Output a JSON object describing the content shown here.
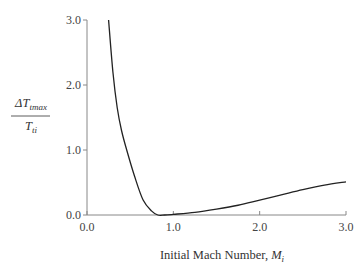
{
  "chart_data": {
    "type": "line",
    "title": "",
    "xlabel": "Initial Mach Number, M_i",
    "xlabel_main": "Initial Mach Number, ",
    "xlabel_var": "M",
    "xlabel_sub": "i",
    "ylabel": "ΔT_tmax / T_ti",
    "ylabel_num": "ΔT",
    "ylabel_num_sub": "tmax",
    "ylabel_den": "T",
    "ylabel_den_sub": "ti",
    "xlim": [
      0.0,
      3.0
    ],
    "ylim": [
      0.0,
      3.0
    ],
    "x_ticks": [
      "0.0",
      "1.0",
      "2.0",
      "3.0"
    ],
    "y_ticks": [
      "0.0",
      "1.0",
      "2.0",
      "3.0"
    ],
    "grid": false,
    "legend": null,
    "series": [
      {
        "name": "ΔT_tmax/T_ti",
        "x": [
          0.25,
          0.3,
          0.35,
          0.4,
          0.46,
          0.55,
          0.65,
          0.75,
          0.82,
          0.9,
          1.0,
          1.25,
          1.5,
          1.75,
          2.0,
          2.25,
          2.5,
          2.75,
          3.0
        ],
        "y": [
          3.0,
          2.2,
          1.65,
          1.3,
          1.0,
          0.6,
          0.23,
          0.06,
          0.0,
          0.0,
          0.01,
          0.04,
          0.09,
          0.15,
          0.23,
          0.31,
          0.39,
          0.46,
          0.51
        ]
      }
    ]
  }
}
